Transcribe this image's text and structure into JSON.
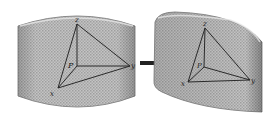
{
  "diagram": {
    "colors": {
      "surface_fill": "#b8b8b8",
      "surface_edge": "#8a8a8a",
      "lines": "#2a2a2a",
      "arrow": "#222222",
      "background": "#ffffff"
    },
    "left_panel": {
      "shape": "flat-cylinder-patch",
      "labels": {
        "top": "z",
        "right": "y",
        "bottom_left": "x",
        "center": "P"
      }
    },
    "arrow": {
      "direction": "right"
    },
    "right_panel": {
      "shape": "curved-patch",
      "labels": {
        "top": "z",
        "right": "y",
        "bottom_left": "x",
        "center": "P"
      }
    }
  }
}
